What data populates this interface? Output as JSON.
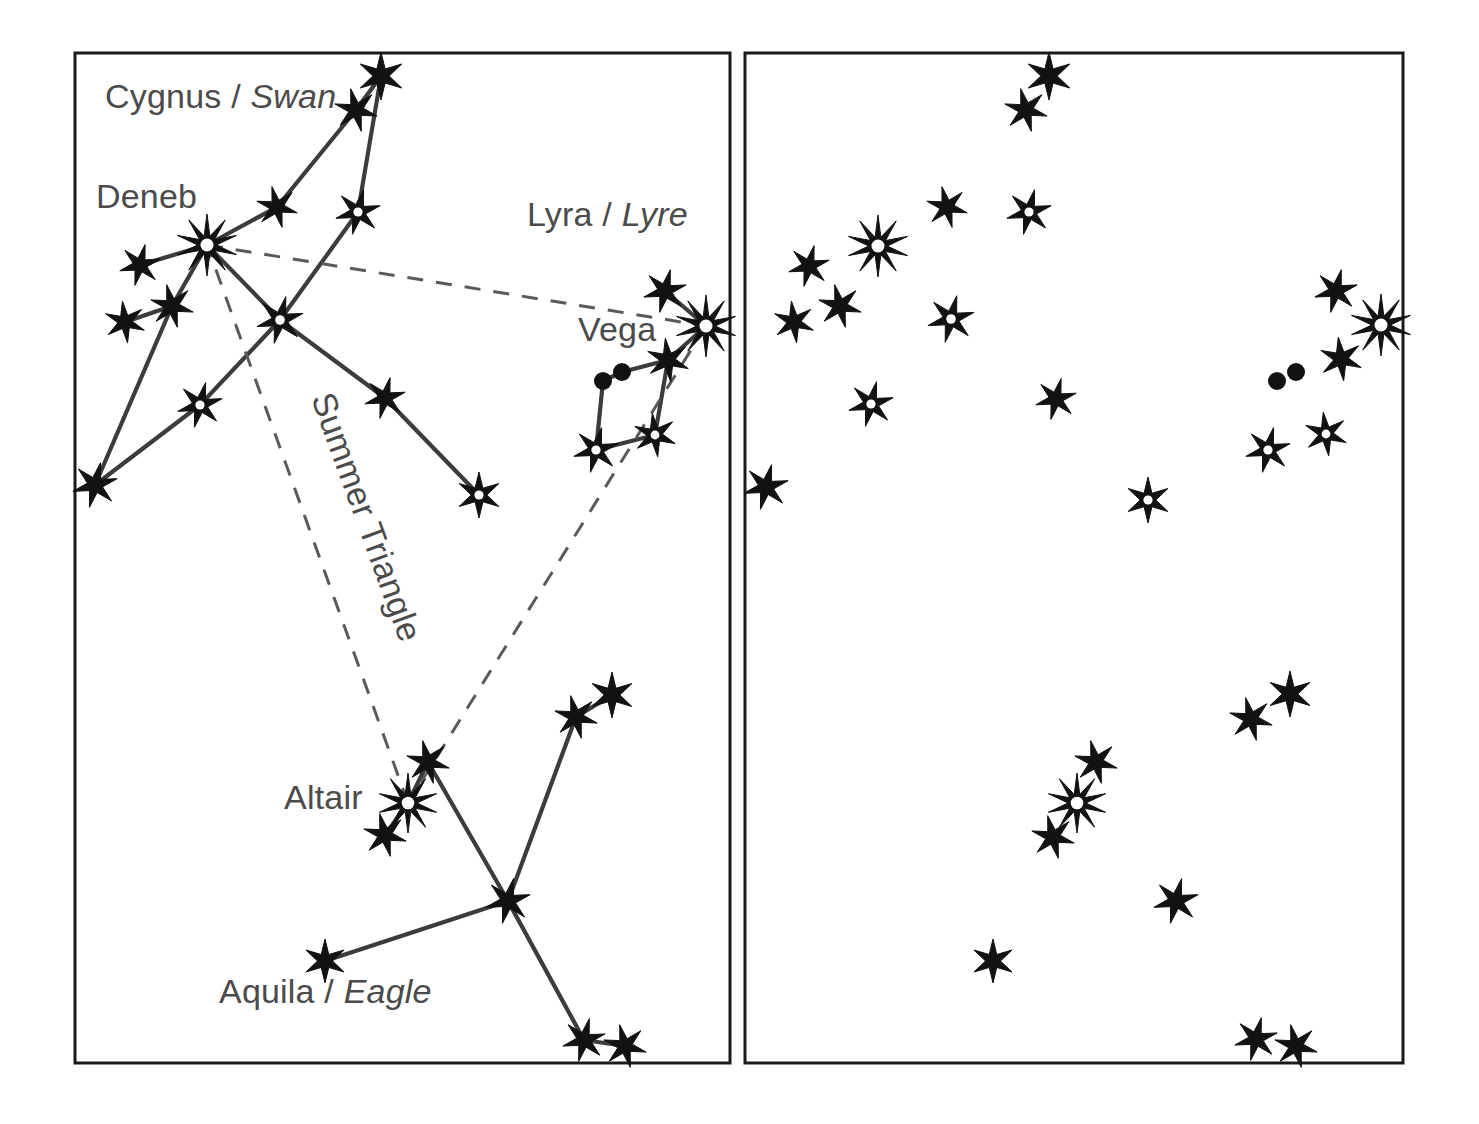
{
  "figure": {
    "background_color": "#ffffff",
    "line_color": "#3c3c3c",
    "dashed_color": "#5a5a5a",
    "star_color": "#121212",
    "label_color": "#4b4b4b",
    "width": 1479,
    "height": 1124
  },
  "panels": [
    {
      "id": "left-panel",
      "name": "labelled-constellation-panel",
      "x": 75,
      "y": 53,
      "width": 655,
      "height": 1010,
      "shows_lines": true,
      "shows_labels": true
    },
    {
      "id": "right-panel",
      "name": "unlabelled-star-field-panel",
      "x": 745,
      "y": 53,
      "width": 658,
      "height": 1010,
      "shows_lines": false,
      "shows_labels": false
    }
  ],
  "labels": [
    {
      "name": "cygnus-label",
      "roman": "Cygnus / ",
      "italic": "Swan",
      "x": 105,
      "y": 108,
      "anchor": "start",
      "rotation": 0
    },
    {
      "name": "deneb-label",
      "roman": "Deneb",
      "italic": "",
      "x": 96,
      "y": 208,
      "anchor": "start",
      "rotation": 0
    },
    {
      "name": "lyra-label",
      "roman": "Lyra / ",
      "italic": "Lyre",
      "x": 527,
      "y": 226,
      "anchor": "start",
      "rotation": 0
    },
    {
      "name": "vega-label",
      "roman": "Vega",
      "italic": "",
      "x": 578,
      "y": 341,
      "anchor": "start",
      "rotation": 0
    },
    {
      "name": "summer-triangle-label",
      "roman": "Summer Triangle",
      "italic": "",
      "x": 311,
      "y": 398,
      "anchor": "start",
      "rotation": 70
    },
    {
      "name": "altair-label",
      "roman": "Altair",
      "italic": "",
      "x": 284,
      "y": 809,
      "anchor": "start",
      "rotation": 0
    },
    {
      "name": "aquila-label",
      "roman": "Aquila / ",
      "italic": "Eagle",
      "x": 219,
      "y": 1003,
      "anchor": "start",
      "rotation": 0
    }
  ],
  "chart_data": {
    "type": "scatter",
    "subtitle": "Left panel labelled with constellation lines; right panel star field only",
    "xlabel": "",
    "ylabel": "",
    "grid": false,
    "legend": "none",
    "star_types": {
      "solid": "filled star, fainter magnitude",
      "ringed": "filled star with white centre, medium magnitude",
      "bright": "10-point star with white centre, brightest magnitude",
      "dot": "round filled dot, very faint star"
    },
    "constellations": [
      {
        "name": "Cygnus",
        "common_name": "Swan",
        "named_stars": [
          "Deneb"
        ],
        "stars": [
          {
            "id": "cyg-tail-top",
            "x": 381,
            "y": 76,
            "type": "solid",
            "points": 6,
            "size": 24
          },
          {
            "id": "cyg-tail-2",
            "x": 356,
            "y": 110,
            "type": "solid",
            "points": 6,
            "size": 22
          },
          {
            "id": "cyg-wingE-upper",
            "x": 358,
            "y": 212,
            "type": "ringed",
            "points": 6,
            "size": 23
          },
          {
            "id": "cyg-wingW-mid",
            "x": 277,
            "y": 207,
            "type": "solid",
            "points": 6,
            "size": 21
          },
          {
            "id": "deneb",
            "x": 207,
            "y": 245,
            "type": "bright",
            "points": 10,
            "size": 31,
            "label": "Deneb"
          },
          {
            "id": "cyg-wingW-tip1",
            "x": 140,
            "y": 265,
            "type": "solid",
            "points": 6,
            "size": 21
          },
          {
            "id": "cyg-center",
            "x": 280,
            "y": 320,
            "type": "ringed",
            "points": 6,
            "size": 24
          },
          {
            "id": "cyg-wingW-2",
            "x": 172,
            "y": 306,
            "type": "solid",
            "points": 6,
            "size": 22
          },
          {
            "id": "cyg-wingW-3",
            "x": 125,
            "y": 322,
            "type": "solid",
            "points": 6,
            "size": 21
          },
          {
            "id": "cyg-wingW-low",
            "x": 200,
            "y": 405,
            "type": "ringed",
            "points": 6,
            "size": 23
          },
          {
            "id": "cyg-wing-tip-sw",
            "x": 95,
            "y": 485,
            "type": "solid",
            "points": 6,
            "size": 23
          },
          {
            "id": "cyg-wingE-low",
            "x": 385,
            "y": 398,
            "type": "solid",
            "points": 6,
            "size": 21
          },
          {
            "id": "cyg-wingE-tip",
            "x": 479,
            "y": 495,
            "type": "ringed",
            "points": 6,
            "size": 23
          }
        ],
        "lines": [
          [
            "cyg-tail-top",
            "cyg-tail-2"
          ],
          [
            "cyg-tail-top",
            "cyg-wingE-upper"
          ],
          [
            "cyg-tail-2",
            "cyg-wingW-mid"
          ],
          [
            "cyg-wingW-mid",
            "deneb"
          ],
          [
            "cyg-wingE-upper",
            "cyg-center"
          ],
          [
            "deneb",
            "cyg-wingW-tip1"
          ],
          [
            "deneb",
            "cyg-center"
          ],
          [
            "deneb",
            "cyg-wingW-2"
          ],
          [
            "cyg-wingW-2",
            "cyg-wingW-3"
          ],
          [
            "cyg-wingW-2",
            "cyg-wing-tip-sw"
          ],
          [
            "cyg-center",
            "cyg-wingW-low"
          ],
          [
            "cyg-wingW-low",
            "cyg-wing-tip-sw"
          ],
          [
            "cyg-center",
            "cyg-wingE-low"
          ],
          [
            "cyg-wingE-low",
            "cyg-wingE-tip"
          ]
        ]
      },
      {
        "name": "Lyra",
        "common_name": "Lyre",
        "named_stars": [
          "Vega"
        ],
        "stars": [
          {
            "id": "lyr-upper",
            "x": 665,
            "y": 291,
            "type": "solid",
            "points": 6,
            "size": 22
          },
          {
            "id": "vega",
            "x": 706,
            "y": 326,
            "type": "bright",
            "points": 10,
            "size": 31,
            "label": "Vega"
          },
          {
            "id": "lyr-ne",
            "x": 668,
            "y": 360,
            "type": "solid",
            "points": 6,
            "size": 22
          },
          {
            "id": "lyr-dot-a",
            "x": 622,
            "y": 372,
            "type": "dot",
            "points": 0,
            "size": 9
          },
          {
            "id": "lyr-dot-b",
            "x": 603,
            "y": 381,
            "type": "dot",
            "points": 0,
            "size": 9
          },
          {
            "id": "lyr-se",
            "x": 655,
            "y": 435,
            "type": "ringed",
            "points": 6,
            "size": 22
          },
          {
            "id": "lyr-sw",
            "x": 596,
            "y": 450,
            "type": "ringed",
            "points": 6,
            "size": 23
          }
        ],
        "lines": [
          [
            "lyr-upper",
            "vega"
          ],
          [
            "vega",
            "lyr-ne"
          ],
          [
            "lyr-ne",
            "lyr-dot-a"
          ],
          [
            "lyr-dot-a",
            "lyr-dot-b"
          ],
          [
            "lyr-dot-b",
            "lyr-sw"
          ],
          [
            "lyr-sw",
            "lyr-se"
          ],
          [
            "lyr-se",
            "lyr-ne"
          ]
        ]
      },
      {
        "name": "Aquila",
        "common_name": "Eagle",
        "named_stars": [
          "Altair"
        ],
        "stars": [
          {
            "id": "aql-ne-tip",
            "x": 612,
            "y": 695,
            "type": "solid",
            "points": 6,
            "size": 23
          },
          {
            "id": "aql-ne-2",
            "x": 576,
            "y": 717,
            "type": "solid",
            "points": 6,
            "size": 22
          },
          {
            "id": "aql-head",
            "x": 428,
            "y": 762,
            "type": "solid",
            "points": 6,
            "size": 22
          },
          {
            "id": "altair",
            "x": 408,
            "y": 803,
            "type": "bright",
            "points": 10,
            "size": 30,
            "label": "Altair"
          },
          {
            "id": "aql-tail-n",
            "x": 385,
            "y": 835,
            "type": "solid",
            "points": 6,
            "size": 22
          },
          {
            "id": "aql-center",
            "x": 508,
            "y": 901,
            "type": "solid",
            "points": 6,
            "size": 23
          },
          {
            "id": "aql-w-tip",
            "x": 325,
            "y": 961,
            "type": "solid",
            "points": 6,
            "size": 22
          },
          {
            "id": "aql-s-1",
            "x": 584,
            "y": 1040,
            "type": "solid",
            "points": 6,
            "size": 22
          },
          {
            "id": "aql-s-2",
            "x": 625,
            "y": 1046,
            "type": "solid",
            "points": 6,
            "size": 22
          }
        ],
        "lines": [
          [
            "aql-ne-tip",
            "aql-ne-2"
          ],
          [
            "aql-ne-2",
            "aql-center"
          ],
          [
            "aql-head",
            "altair"
          ],
          [
            "altair",
            "aql-tail-n"
          ],
          [
            "aql-head",
            "aql-center"
          ],
          [
            "aql-center",
            "aql-w-tip"
          ],
          [
            "aql-center",
            "aql-s-1"
          ],
          [
            "aql-s-1",
            "aql-s-2"
          ]
        ]
      }
    ],
    "summer_triangle": {
      "name": "Summer Triangle",
      "vertices": [
        "deneb",
        "vega",
        "altair"
      ],
      "vertex_points": [
        {
          "id": "deneb",
          "x": 207,
          "y": 245
        },
        {
          "id": "vega",
          "x": 706,
          "y": 326
        },
        {
          "id": "altair",
          "x": 408,
          "y": 803
        }
      ],
      "style": "dashed"
    },
    "right_panel_stars": [
      {
        "id": "r-cyg-tail-top",
        "x": 1049,
        "y": 76,
        "type": "solid",
        "points": 6,
        "size": 24
      },
      {
        "id": "r-cyg-tail-2",
        "x": 1026,
        "y": 110,
        "type": "solid",
        "points": 6,
        "size": 22
      },
      {
        "id": "r-cyg-wingE-upper",
        "x": 1029,
        "y": 212,
        "type": "ringed",
        "points": 6,
        "size": 23
      },
      {
        "id": "r-cyg-wingW-mid",
        "x": 947,
        "y": 207,
        "type": "solid",
        "points": 6,
        "size": 21
      },
      {
        "id": "r-deneb",
        "x": 878,
        "y": 246,
        "type": "bright",
        "points": 10,
        "size": 31
      },
      {
        "id": "r-cyg-wingW-tip1",
        "x": 809,
        "y": 266,
        "type": "solid",
        "points": 6,
        "size": 21
      },
      {
        "id": "r-cyg-center",
        "x": 951,
        "y": 319,
        "type": "ringed",
        "points": 6,
        "size": 24
      },
      {
        "id": "r-cyg-wingW-2",
        "x": 840,
        "y": 306,
        "type": "solid",
        "points": 6,
        "size": 22
      },
      {
        "id": "r-cyg-wingW-3",
        "x": 794,
        "y": 322,
        "type": "solid",
        "points": 6,
        "size": 21
      },
      {
        "id": "r-cyg-wingW-low",
        "x": 871,
        "y": 404,
        "type": "ringed",
        "points": 6,
        "size": 23
      },
      {
        "id": "r-cyg-wing-tip-sw",
        "x": 766,
        "y": 487,
        "type": "solid",
        "points": 6,
        "size": 23
      },
      {
        "id": "r-cyg-wingE-low",
        "x": 1056,
        "y": 399,
        "type": "solid",
        "points": 6,
        "size": 21
      },
      {
        "id": "r-cyg-wingE-tip",
        "x": 1148,
        "y": 500,
        "type": "ringed",
        "points": 6,
        "size": 23
      },
      {
        "id": "r-lyr-upper",
        "x": 1336,
        "y": 291,
        "type": "solid",
        "points": 6,
        "size": 22
      },
      {
        "id": "r-vega",
        "x": 1381,
        "y": 325,
        "type": "bright",
        "points": 10,
        "size": 31
      },
      {
        "id": "r-lyr-ne",
        "x": 1341,
        "y": 359,
        "type": "solid",
        "points": 6,
        "size": 22
      },
      {
        "id": "r-lyr-dot-a",
        "x": 1296,
        "y": 372,
        "type": "dot",
        "points": 0,
        "size": 9
      },
      {
        "id": "r-lyr-dot-b",
        "x": 1277,
        "y": 381,
        "type": "dot",
        "points": 0,
        "size": 9
      },
      {
        "id": "r-lyr-se",
        "x": 1326,
        "y": 434,
        "type": "ringed",
        "points": 6,
        "size": 22
      },
      {
        "id": "r-lyr-sw",
        "x": 1268,
        "y": 450,
        "type": "ringed",
        "points": 6,
        "size": 23
      },
      {
        "id": "r-aql-ne-tip",
        "x": 1290,
        "y": 694,
        "type": "solid",
        "points": 6,
        "size": 23
      },
      {
        "id": "r-aql-ne-2",
        "x": 1251,
        "y": 719,
        "type": "solid",
        "points": 6,
        "size": 22
      },
      {
        "id": "r-aql-head",
        "x": 1096,
        "y": 762,
        "type": "solid",
        "points": 6,
        "size": 22
      },
      {
        "id": "r-altair",
        "x": 1077,
        "y": 803,
        "type": "bright",
        "points": 10,
        "size": 30
      },
      {
        "id": "r-aql-tail-n",
        "x": 1053,
        "y": 837,
        "type": "solid",
        "points": 6,
        "size": 22
      },
      {
        "id": "r-aql-center",
        "x": 1176,
        "y": 901,
        "type": "solid",
        "points": 6,
        "size": 23
      },
      {
        "id": "r-aql-w-tip",
        "x": 993,
        "y": 961,
        "type": "solid",
        "points": 6,
        "size": 22
      },
      {
        "id": "r-aql-s-1",
        "x": 1256,
        "y": 1039,
        "type": "solid",
        "points": 6,
        "size": 22
      },
      {
        "id": "r-aql-s-2",
        "x": 1296,
        "y": 1046,
        "type": "solid",
        "points": 6,
        "size": 22
      }
    ]
  }
}
